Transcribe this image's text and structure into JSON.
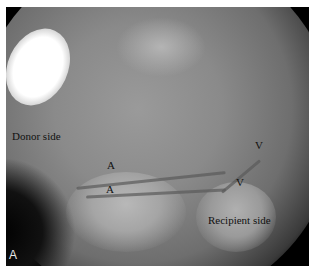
{
  "figure": {
    "panel_label": "A",
    "annotations": {
      "donor_side": "Donor side",
      "recipient_side": "Recipient side",
      "artery_1": "A",
      "artery_2": "A",
      "vein_1": "V",
      "vein_2": "V"
    }
  }
}
